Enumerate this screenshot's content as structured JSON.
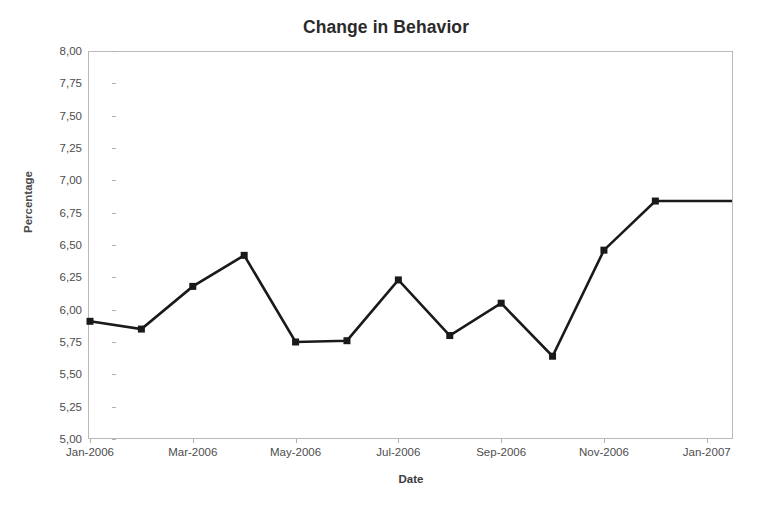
{
  "chart_data": {
    "type": "line",
    "title": "Change in Behavior",
    "xlabel": "Date",
    "ylabel": "Percentage",
    "grid": false,
    "legend": "none",
    "x": [
      "Jan-2006",
      "Feb-2006",
      "Mar-2006",
      "Apr-2006",
      "May-2006",
      "Jun-2006",
      "Jul-2006",
      "Aug-2006",
      "Sep-2006",
      "Oct-2006",
      "Nov-2006",
      "Dec-2006"
    ],
    "values": [
      5.91,
      5.85,
      6.18,
      6.42,
      5.75,
      5.76,
      6.23,
      5.8,
      6.05,
      5.64,
      6.46,
      6.84
    ],
    "series": [
      {
        "name": "Percentage",
        "values": [
          5.91,
          5.85,
          6.18,
          6.42,
          5.75,
          5.76,
          6.23,
          5.8,
          6.05,
          5.64,
          6.46,
          6.84
        ],
        "color": "#1a1a1a",
        "marker": "square"
      }
    ],
    "ylim": [
      5.0,
      8.0
    ],
    "y_ticks": [
      "5,00",
      "5,25",
      "5,50",
      "5,75",
      "6,00",
      "6,25",
      "6,50",
      "6,75",
      "7,00",
      "7,25",
      "7,50",
      "7,75",
      "8,00"
    ],
    "y_tick_values": [
      5.0,
      5.25,
      5.5,
      5.75,
      6.0,
      6.25,
      6.5,
      6.75,
      7.0,
      7.25,
      7.5,
      7.75,
      8.0
    ],
    "x_ticks": [
      "Jan-2006",
      "Mar-2006",
      "May-2006",
      "Jul-2006",
      "Sep-2006",
      "Nov-2006",
      "Jan-2007"
    ],
    "x_tick_indices": [
      0,
      2,
      4,
      6,
      8,
      10,
      12
    ],
    "decimal_separator": ",",
    "line_color": "#1a1a1a",
    "frame_color": "#b9b9b9",
    "background": "#ffffff",
    "title_color": "#2b2b2b",
    "tick_color": "#4d4d4d"
  }
}
